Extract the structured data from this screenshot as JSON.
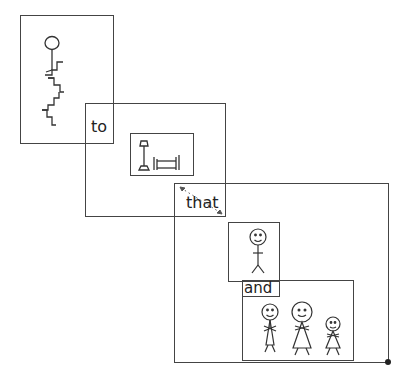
{
  "diagram": {
    "type": "symbol-sentence",
    "cards": [
      {
        "id": "card-climbing",
        "symbol": "person-climbing-stairs"
      },
      {
        "id": "card-to",
        "label": "to",
        "inner_symbol": "lamp-and-bed"
      },
      {
        "id": "card-that",
        "label": "that",
        "inner_symbol": "person-smiling"
      },
      {
        "id": "card-and",
        "label": "and",
        "inner_symbol": "family-three-people"
      }
    ],
    "line_color": "#444444",
    "background": "#ffffff"
  },
  "labels": {
    "to": "to",
    "that": "that",
    "and": "and"
  }
}
